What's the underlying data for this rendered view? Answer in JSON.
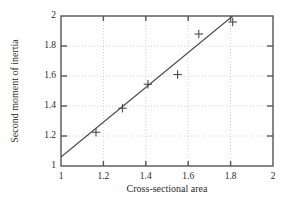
{
  "chart_data": {
    "type": "scatter",
    "title": "",
    "xlabel": "Cross-sectional area",
    "ylabel": "Second moment of inertia",
    "xlim": [
      1,
      2
    ],
    "ylim": [
      1,
      2
    ],
    "xticks": [
      "1",
      "1.2",
      "1.4",
      "1.6",
      "1.8",
      "2"
    ],
    "xtick_values": [
      1,
      1.2,
      1.4,
      1.6,
      1.8,
      2
    ],
    "yticks": [
      "1",
      "1.2",
      "1.4",
      "1.6",
      "1.8",
      "2"
    ],
    "ytick_values": [
      1,
      1.2,
      1.4,
      1.6,
      1.8,
      2
    ],
    "grid": true,
    "grid_style": "dotted",
    "legend": null,
    "marker": "plus",
    "marker_color": "#4a4a4a",
    "line_color": "#4a4a4a",
    "axis_color": "#555555",
    "grid_color": "#c8c8c8",
    "background": "#ffffff",
    "series": [
      {
        "name": "measurements",
        "type": "scatter",
        "x": [
          1.165,
          1.29,
          1.41,
          1.55,
          1.65,
          1.81
        ],
        "y": [
          1.225,
          1.385,
          1.545,
          1.61,
          1.88,
          1.96
        ]
      },
      {
        "name": "fit-line",
        "type": "line",
        "x": [
          1.0,
          1.81
        ],
        "y": [
          1.06,
          2.0
        ]
      }
    ]
  }
}
